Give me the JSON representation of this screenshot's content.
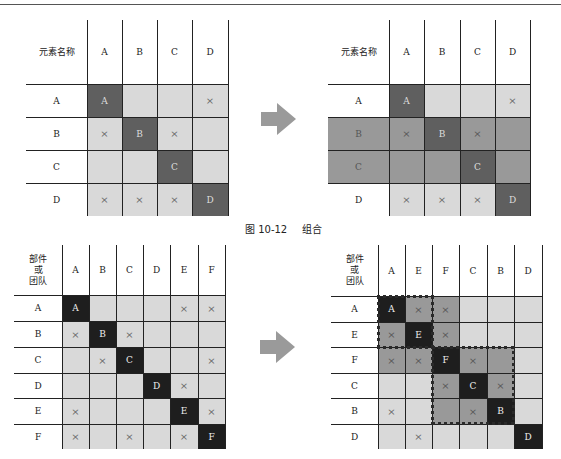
{
  "caption": {
    "figure": "图 10-12",
    "title": "组合"
  },
  "colors": {
    "light": "#d9d9d9",
    "medium": "#999999",
    "dark": "#5f5f5f",
    "black": "#1e1e1e"
  },
  "top_left": {
    "corner": "元素名称",
    "cols": [
      "A",
      "B",
      "C",
      "D"
    ],
    "rows": [
      "A",
      "B",
      "C",
      "D"
    ],
    "cells": [
      [
        "A",
        "",
        "",
        "×"
      ],
      [
        "×",
        "B",
        "×",
        ""
      ],
      [
        "",
        "",
        "C",
        ""
      ],
      [
        "×",
        "×",
        "×",
        "D"
      ]
    ]
  },
  "top_right": {
    "corner": "元素名称",
    "cols": [
      "A",
      "B",
      "C",
      "D"
    ],
    "rows": [
      "A",
      "B",
      "C",
      "D"
    ],
    "cells": [
      [
        "A",
        "",
        "",
        "×"
      ],
      [
        "×",
        "B",
        "×",
        ""
      ],
      [
        "",
        "",
        "C",
        ""
      ],
      [
        "×",
        "×",
        "×",
        "D"
      ]
    ],
    "highlight_rows": [
      "B",
      "C"
    ]
  },
  "bottom_left": {
    "corner": "部件\n或\n团队",
    "cols": [
      "A",
      "B",
      "C",
      "D",
      "E",
      "F"
    ],
    "rows": [
      "A",
      "B",
      "C",
      "D",
      "E",
      "F"
    ],
    "cells": [
      [
        "A",
        "",
        "",
        "",
        "×",
        "×"
      ],
      [
        "×",
        "B",
        "×",
        "",
        "",
        ""
      ],
      [
        "",
        "×",
        "C",
        "",
        "",
        "×"
      ],
      [
        "",
        "",
        "",
        "D",
        "×",
        ""
      ],
      [
        "×",
        "",
        "",
        "",
        "E",
        "×"
      ],
      [
        "×",
        "",
        "×",
        "",
        "×",
        "F"
      ]
    ]
  },
  "bottom_right": {
    "corner": "部件\n或\n团队",
    "cols": [
      "A",
      "E",
      "F",
      "C",
      "B",
      "D"
    ],
    "rows": [
      "A",
      "E",
      "F",
      "C",
      "B",
      "D"
    ],
    "cells": [
      [
        "A",
        "×",
        "×",
        "",
        "",
        ""
      ],
      [
        "×",
        "E",
        "×",
        "",
        "",
        ""
      ],
      [
        "×",
        "×",
        "F",
        "×",
        "",
        ""
      ],
      [
        "",
        "",
        "×",
        "C",
        "×",
        ""
      ],
      [
        "×",
        "",
        "",
        "×",
        "B",
        ""
      ],
      [
        "",
        "×",
        "",
        "",
        "",
        "D"
      ]
    ],
    "clusters": [
      {
        "name": "cluster-AEF",
        "members": [
          "A",
          "E",
          "F"
        ]
      },
      {
        "name": "cluster-FCB",
        "members": [
          "F",
          "C",
          "B"
        ]
      }
    ]
  }
}
